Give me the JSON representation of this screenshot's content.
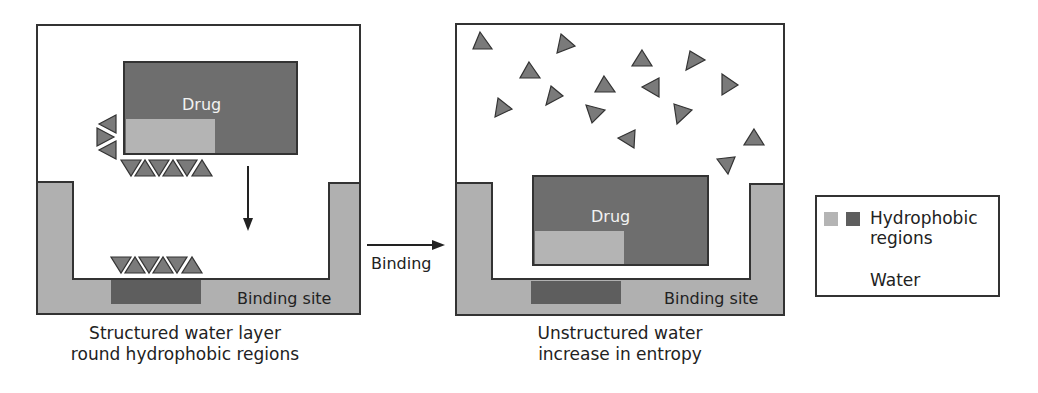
{
  "colors": {
    "outline": "#333333",
    "drug_dark": "#6e6e6e",
    "hydrophobic_light": "#b4b4b4",
    "binding_wall": "#b0b0b0",
    "pocket_dark": "#5e5e5e",
    "water": "#7a7a7a",
    "background": "#ffffff"
  },
  "left_panel": {
    "drug_label": "Drug",
    "binding_site_label": "Binding site",
    "caption_line1": "Structured water layer",
    "caption_line2": "round hydrophobic regions"
  },
  "transition": {
    "label": "Binding"
  },
  "right_panel": {
    "drug_label": "Drug",
    "binding_site_label": "Binding site",
    "caption_line1": "Unstructured water",
    "caption_line2": "increase in entropy"
  },
  "legend": {
    "hydrophobic_line1": "Hydrophobic",
    "hydrophobic_line2": "regions",
    "water_label": "Water"
  }
}
